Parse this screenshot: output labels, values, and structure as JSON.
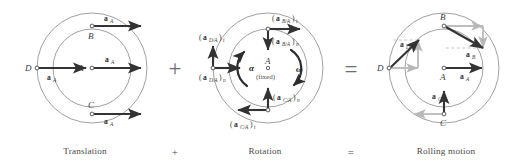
{
  "figure": {
    "type": "physics-diagram",
    "background_color": "#ffffff",
    "stroke_color": "#8a8a8a",
    "vector_color": "#333333",
    "construction_color": "#b5b5b5",
    "text_color": "#3b3b3b"
  },
  "operators": {
    "plus": "+",
    "equals": "="
  },
  "captions": {
    "translation": "Translation",
    "plus": "+",
    "rotation": "Rotation",
    "equals": "=",
    "rolling": "Rolling motion"
  },
  "panels": [
    {
      "id": "translation",
      "caption": "Translation",
      "center_label": "A",
      "points": [
        {
          "id": "A",
          "label": "A",
          "x": 92,
          "y": 68
        },
        {
          "id": "B",
          "label": "B",
          "x": 92,
          "y": 29
        },
        {
          "id": "C",
          "label": "C",
          "x": 92,
          "y": 110
        },
        {
          "id": "D",
          "label": "D",
          "x": 37,
          "y": 68
        }
      ],
      "vectors": [
        {
          "id": "aA-at-B",
          "label": "a",
          "sub": "A",
          "from": "B",
          "direction": "right"
        },
        {
          "id": "aA-at-A",
          "label": "a",
          "sub": "A",
          "from": "A",
          "direction": "right"
        },
        {
          "id": "aA-at-C",
          "label": "a",
          "sub": "A",
          "from": "C",
          "direction": "right"
        },
        {
          "id": "aA-at-D",
          "label": "a",
          "sub": "A",
          "from": "D",
          "direction": "right"
        }
      ]
    },
    {
      "id": "rotation",
      "caption": "Rotation",
      "center_label": "A",
      "center_note": "(fixed)",
      "alpha_symbol": "α",
      "omega_symbol": "ω",
      "points": [
        {
          "id": "A",
          "label": "A",
          "x": 268,
          "y": 68
        },
        {
          "id": "B",
          "label": "B",
          "x": 268,
          "y": 29
        },
        {
          "id": "C",
          "label": "C",
          "x": 268,
          "y": 110
        },
        {
          "id": "D",
          "label": "D",
          "x": 213,
          "y": 68
        }
      ],
      "vectors": [
        {
          "id": "aBA-t",
          "label": "(a",
          "sub": "B/A",
          "close": ")",
          "comp": "t",
          "from": "B",
          "direction": "right"
        },
        {
          "id": "aBA-n",
          "label": "(a",
          "sub": "B/A",
          "close": ")",
          "comp": "n",
          "from": "B",
          "direction": "down"
        },
        {
          "id": "aDA-t",
          "label": "(a",
          "sub": "D/A",
          "close": ")",
          "comp": "t",
          "from": "D",
          "direction": "up"
        },
        {
          "id": "aDA-n",
          "label": "(a",
          "sub": "D/A",
          "close": ")",
          "comp": "n",
          "from": "D",
          "direction": "right"
        },
        {
          "id": "aCA-n",
          "label": "(a",
          "sub": "C/A",
          "close": ")",
          "comp": "n",
          "from": "C",
          "direction": "up"
        },
        {
          "id": "aCA-t",
          "label": "(a",
          "sub": "C/A",
          "close": ")",
          "comp": "t",
          "from": "C",
          "direction": "left"
        }
      ]
    },
    {
      "id": "rolling",
      "caption": "Rolling motion",
      "center_label": "A",
      "points": [
        {
          "id": "A",
          "label": "A",
          "x": 444,
          "y": 68
        },
        {
          "id": "B",
          "label": "B",
          "x": 444,
          "y": 29
        },
        {
          "id": "C",
          "label": "C",
          "x": 444,
          "y": 110
        },
        {
          "id": "D",
          "label": "D",
          "x": 389,
          "y": 68
        }
      ],
      "vectors": [
        {
          "id": "aD",
          "label": "a",
          "sub": "D",
          "from": "D",
          "direction": "up-right"
        },
        {
          "id": "aB",
          "label": "a",
          "sub": "B",
          "from": "B",
          "direction": "down-right"
        },
        {
          "id": "aA",
          "label": "a",
          "sub": "A",
          "from": "A",
          "direction": "right"
        },
        {
          "id": "aC",
          "label": "a",
          "sub": "C",
          "from": "C",
          "direction": "up"
        }
      ]
    }
  ],
  "labels": {
    "a": "a",
    "sub_A": "A",
    "sub_B": "B",
    "sub_C": "C",
    "sub_D": "D",
    "sub_BA": "B/A",
    "sub_CA": "C/A",
    "sub_DA": "D/A",
    "paren_open": "(",
    "paren_close": ")",
    "comp_t": "t",
    "comp_n": "n",
    "point_A": "A",
    "point_B": "B",
    "point_C": "C",
    "point_D": "D",
    "fixed": "(fixed)",
    "alpha": "α",
    "omega": "ω"
  }
}
